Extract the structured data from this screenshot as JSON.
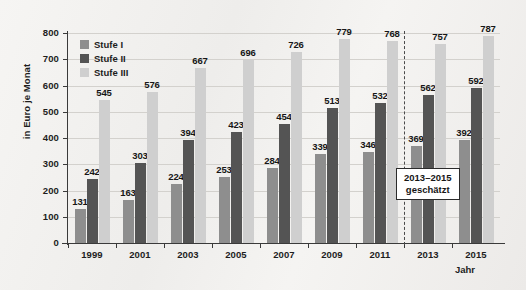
{
  "chart_data": {
    "type": "bar",
    "title": "",
    "subtitle": "",
    "xlabel": "Jahr",
    "ylabel": "in Euro je Monat",
    "ylim": [
      0,
      800
    ],
    "ytick_step": 100,
    "yticks": [
      "0",
      "100",
      "200",
      "300",
      "400",
      "500",
      "600",
      "700",
      "800"
    ],
    "grid": true,
    "legend_position": "top-left",
    "categories": [
      "1999",
      "2001",
      "2003",
      "2005",
      "2007",
      "2009",
      "2011",
      "2013",
      "2015"
    ],
    "series": [
      {
        "name": "Stufe I",
        "color": "#8e8e8e",
        "values": [
          131,
          163,
          224,
          253,
          284,
          339,
          346,
          369,
          392
        ]
      },
      {
        "name": "Stufe II",
        "color": "#545454",
        "values": [
          242,
          303,
          394,
          423,
          454,
          513,
          532,
          562,
          592
        ]
      },
      {
        "name": "Stufe III",
        "color": "#cfcfcf",
        "values": [
          545,
          576,
          667,
          696,
          726,
          779,
          768,
          757,
          787
        ]
      }
    ],
    "annotations": [
      {
        "name": "forecast-note",
        "lines": [
          "2013–2015",
          "geschätzt"
        ],
        "after_category": "2011"
      }
    ],
    "divider": {
      "after_category": "2011",
      "style": "dashed"
    }
  }
}
